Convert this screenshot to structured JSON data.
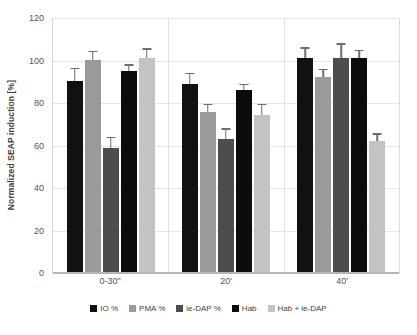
{
  "chart_data": {
    "type": "bar",
    "title": "",
    "xlabel": "",
    "ylabel": "Normalized SEAP induction [%]",
    "ylim": [
      0,
      120
    ],
    "ytick_labels": [
      "0",
      "20",
      "40",
      "60",
      "80",
      "100",
      "120"
    ],
    "yticks": [
      0,
      20,
      40,
      60,
      80,
      100,
      120
    ],
    "grid": true,
    "legend_position": "bottom",
    "categories": [
      "0-30\"",
      "20'",
      "40'"
    ],
    "series": [
      {
        "name": "IO %",
        "color": "#111111",
        "values": [
          90,
          88.5,
          100.5
        ],
        "errors": [
          5.5,
          4.5,
          4.5
        ]
      },
      {
        "name": "PMA %",
        "color": "#9a9a9a",
        "values": [
          100,
          75.5,
          92
        ],
        "errors": [
          3.5,
          3,
          3
        ]
      },
      {
        "name": "ie-DAP %",
        "color": "#4d4d4d",
        "values": [
          58.5,
          62.5,
          100.5
        ],
        "errors": [
          4.5,
          4.5,
          6.5
        ]
      },
      {
        "name": "Hab",
        "color": "#0c0c0c",
        "values": [
          94.5,
          85.5,
          100.5
        ],
        "errors": [
          2.5,
          2.5,
          3.5
        ]
      },
      {
        "name": "Hab + ie-DAP",
        "color": "#c3c3c3",
        "values": [
          100.5,
          74,
          61.5
        ],
        "errors": [
          4,
          4.5,
          3
        ]
      }
    ]
  }
}
